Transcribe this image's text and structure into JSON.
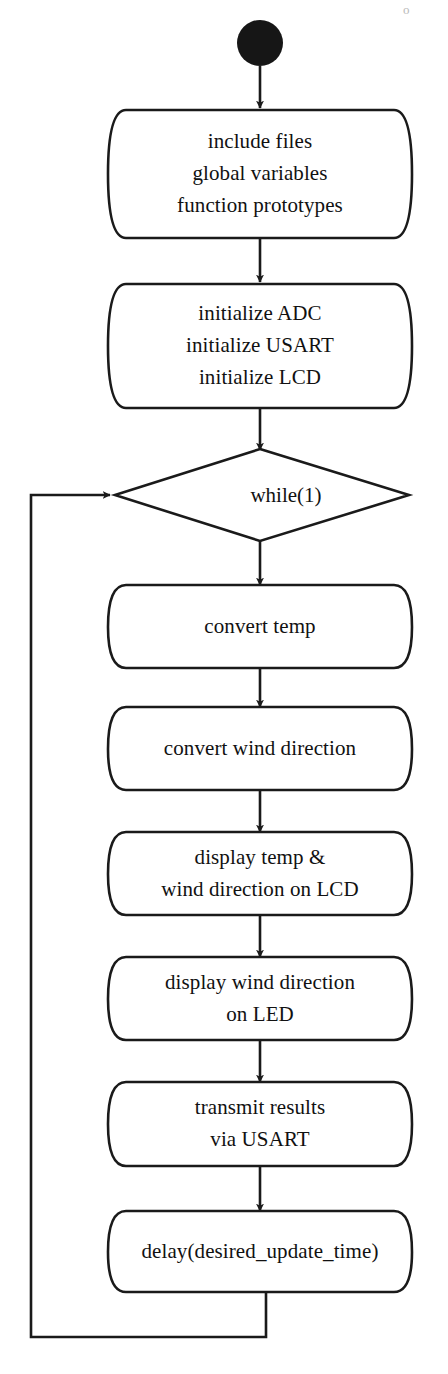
{
  "diagram": {
    "type": "flowchart",
    "title": "",
    "orientation": "top-to-bottom",
    "line_color": "#1a1a1a",
    "fill_color": "#ffffff",
    "text_color": "#111111",
    "start_node": {
      "name": "start",
      "shape": "filled-circle",
      "label": ""
    },
    "nodes": [
      {
        "id": "setup",
        "shape": "rounded-process",
        "lines": [
          "include files",
          "global variables",
          "function prototypes"
        ]
      },
      {
        "id": "init",
        "shape": "rounded-process",
        "lines": [
          "initialize ADC",
          "initialize USART",
          "initialize LCD"
        ]
      },
      {
        "id": "loop",
        "shape": "diamond",
        "lines": [
          "while(1)"
        ]
      },
      {
        "id": "convert-temp",
        "shape": "rounded-process",
        "lines": [
          "convert temp"
        ]
      },
      {
        "id": "convert-wind-direction",
        "shape": "rounded-process",
        "lines": [
          "convert wind direction"
        ]
      },
      {
        "id": "display-lcd",
        "shape": "rounded-process",
        "lines": [
          "display temp &",
          "wind direction on LCD"
        ]
      },
      {
        "id": "display-led",
        "shape": "rounded-process",
        "lines": [
          "display wind direction",
          "on LED"
        ]
      },
      {
        "id": "transmit",
        "shape": "rounded-process",
        "lines": [
          "transmit results",
          "via USART"
        ]
      },
      {
        "id": "delay",
        "shape": "rounded-process",
        "lines": [
          "delay(desired_update_time)"
        ]
      }
    ],
    "edges": [
      {
        "from": "start",
        "to": "setup",
        "label": "",
        "arrow": true
      },
      {
        "from": "setup",
        "to": "init",
        "label": "",
        "arrow": true
      },
      {
        "from": "init",
        "to": "loop",
        "label": "",
        "arrow": true
      },
      {
        "from": "loop",
        "to": "convert-temp",
        "label": "",
        "arrow": true
      },
      {
        "from": "convert-temp",
        "to": "convert-wind-direction",
        "label": "",
        "arrow": true
      },
      {
        "from": "convert-wind-direction",
        "to": "display-lcd",
        "label": "",
        "arrow": true
      },
      {
        "from": "display-lcd",
        "to": "display-led",
        "label": "",
        "arrow": true
      },
      {
        "from": "display-led",
        "to": "transmit",
        "label": "",
        "arrow": true
      },
      {
        "from": "transmit",
        "to": "delay",
        "label": "",
        "arrow": true
      },
      {
        "from": "delay",
        "to": "loop",
        "label": "",
        "arrow": true,
        "routing": "loop-back-left"
      }
    ]
  },
  "artifact": {
    "top_right_mark": "o"
  }
}
